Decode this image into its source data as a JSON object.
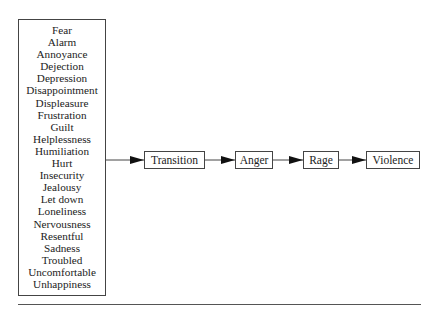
{
  "diagram": {
    "type": "flow",
    "source_list": {
      "items": [
        "Fear",
        "Alarm",
        "Annoyance",
        "Dejection",
        "Depression",
        "Disappointment",
        "Displeasure",
        "Frustration",
        "Guilt",
        "Helplessness",
        "Humiliation",
        "Hurt",
        "Insecurity",
        "Jealousy",
        "Let down",
        "Loneliness",
        "Nervousness",
        "Resentful",
        "Sadness",
        "Troubled",
        "Uncomfortable",
        "Unhappiness"
      ]
    },
    "nodes": [
      {
        "id": "transition",
        "label": "Transition"
      },
      {
        "id": "anger",
        "label": "Anger"
      },
      {
        "id": "rage",
        "label": "Rage"
      },
      {
        "id": "violence",
        "label": "Violence"
      }
    ],
    "edges": [
      {
        "from": "source_list",
        "to": "transition"
      },
      {
        "from": "transition",
        "to": "anger"
      },
      {
        "from": "anger",
        "to": "rage"
      },
      {
        "from": "rage",
        "to": "violence"
      }
    ]
  }
}
